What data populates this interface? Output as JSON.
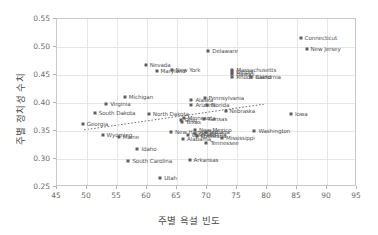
{
  "chart_data": {
    "type": "scatter",
    "title": "",
    "xlabel": "주별 욕설 빈도",
    "ylabel": "주별 정치성 수치",
    "xlim": [
      45,
      95
    ],
    "ylim": [
      0.25,
      0.55
    ],
    "xticks": [
      "45",
      "50",
      "55",
      "60",
      "65",
      "70",
      "75",
      "80",
      "85",
      "90",
      "95"
    ],
    "yticks": [
      "0.25",
      "0.30",
      "0.35",
      "0.40",
      "0.45",
      "0.50",
      "0.55"
    ],
    "grid": true,
    "legend": "none",
    "trendline": {
      "style": "dotted",
      "x0": 49.5,
      "y0": 0.352,
      "x1": 79.5,
      "y1": 0.398
    },
    "points": [
      {
        "label": "Connecticut",
        "x": 85.6,
        "y": 0.516
      },
      {
        "label": "New Jersey",
        "x": 86.6,
        "y": 0.497
      },
      {
        "label": "Delaware",
        "x": 70.2,
        "y": 0.492
      },
      {
        "label": "Nevada",
        "x": 59.8,
        "y": 0.468
      },
      {
        "label": "Maryland",
        "x": 61.6,
        "y": 0.457
      },
      {
        "label": "New York",
        "x": 64.1,
        "y": 0.459
      },
      {
        "label": "Massachusetts",
        "x": 74.2,
        "y": 0.459
      },
      {
        "label": "Illinois",
        "x": 74.2,
        "y": 0.455
      },
      {
        "label": "Hawaii",
        "x": 74.2,
        "y": 0.451
      },
      {
        "label": "Rhode Island",
        "x": 74.2,
        "y": 0.447
      },
      {
        "label": "California",
        "x": 77.4,
        "y": 0.447
      },
      {
        "label": "Michigan",
        "x": 56.3,
        "y": 0.411
      },
      {
        "label": "Virginia",
        "x": 53.2,
        "y": 0.399
      },
      {
        "label": "Alaska",
        "x": 67.4,
        "y": 0.405
      },
      {
        "label": "Pennsylvania",
        "x": 69.6,
        "y": 0.409
      },
      {
        "label": "Arizona",
        "x": 67.4,
        "y": 0.396
      },
      {
        "label": "Florida",
        "x": 70.0,
        "y": 0.397
      },
      {
        "label": "Nebraska",
        "x": 73.1,
        "y": 0.386
      },
      {
        "label": "Iowa",
        "x": 84.0,
        "y": 0.381
      },
      {
        "label": "South Dakota",
        "x": 51.3,
        "y": 0.383
      },
      {
        "label": "North Dakota",
        "x": 60.3,
        "y": 0.381
      },
      {
        "label": "Minnesota",
        "x": 66.1,
        "y": 0.374
      },
      {
        "label": "Ohio",
        "x": 65.6,
        "y": 0.37
      },
      {
        "label": "Texas",
        "x": 65.8,
        "y": 0.366
      },
      {
        "label": "Kansas",
        "x": 69.5,
        "y": 0.371
      },
      {
        "label": "Georgia",
        "x": 49.3,
        "y": 0.363
      },
      {
        "label": "New Hampshire",
        "x": 64.0,
        "y": 0.348
      },
      {
        "label": "New Mexico",
        "x": 68.0,
        "y": 0.351
      },
      {
        "label": "Indiana",
        "x": 69.8,
        "y": 0.349
      },
      {
        "label": "Colorado",
        "x": 66.8,
        "y": 0.343
      },
      {
        "label": "Louisiana",
        "x": 68.3,
        "y": 0.341
      },
      {
        "label": "Oklahoma",
        "x": 68.0,
        "y": 0.345
      },
      {
        "label": "Alabama",
        "x": 66.0,
        "y": 0.336
      },
      {
        "label": "Mississippi",
        "x": 72.5,
        "y": 0.337
      },
      {
        "label": "Tennessee",
        "x": 69.9,
        "y": 0.328
      },
      {
        "label": "Washington",
        "x": 77.9,
        "y": 0.35
      },
      {
        "label": "Wyoming",
        "x": 52.6,
        "y": 0.342
      },
      {
        "label": "Maine",
        "x": 55.3,
        "y": 0.339
      },
      {
        "label": "Idaho",
        "x": 58.4,
        "y": 0.318
      },
      {
        "label": "South Carolina",
        "x": 56.9,
        "y": 0.296
      },
      {
        "label": "Arkansas",
        "x": 67.1,
        "y": 0.299
      },
      {
        "label": "Utah",
        "x": 62.2,
        "y": 0.266
      }
    ]
  }
}
